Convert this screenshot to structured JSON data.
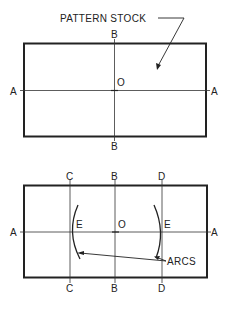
{
  "diagram": {
    "top_figure": {
      "callout": "PATTERN STOCK",
      "labels": {
        "a_left": "A",
        "a_right": "A",
        "b_top": "B",
        "b_bottom": "B",
        "o": "O"
      }
    },
    "bottom_figure": {
      "callout": "ARCS",
      "labels": {
        "a_left": "A",
        "a_right": "A",
        "b_top": "B",
        "b_bottom": "B",
        "c_top": "C",
        "c_bottom": "C",
        "d_top": "D",
        "d_bottom": "D",
        "o": "O",
        "e_left": "E",
        "e_right": "E"
      }
    }
  }
}
